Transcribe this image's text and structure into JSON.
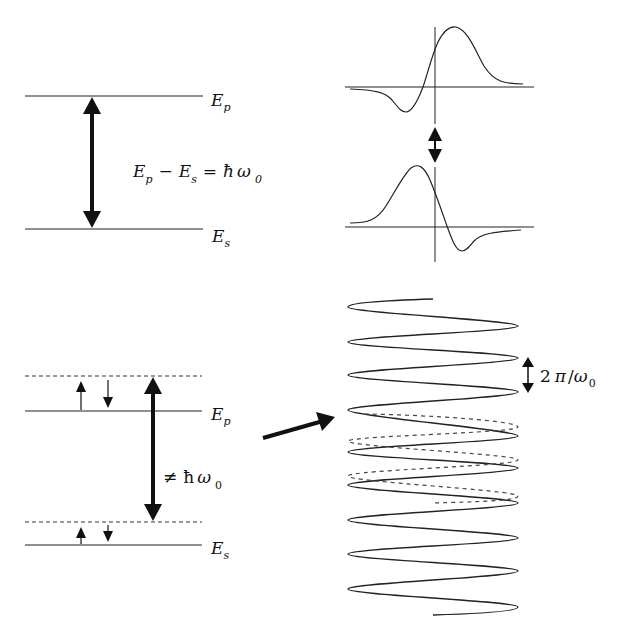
{
  "panels": {
    "top_left": {
      "upper_level_label": "E",
      "upper_level_sub": "p",
      "lower_level_label": "E",
      "lower_level_sub": "s",
      "equation": {
        "a": "E",
        "a_sub": "p",
        "minus": "−",
        "b": "E",
        "b_sub": "s",
        "eq": "=",
        "hbar": "ħ",
        "omega": "ω",
        "omega_sub": "0"
      }
    },
    "top_right": {
      "description": "Two wavepacket curves (antisymmetric derivative-like shapes) connected by a double-headed arrow"
    },
    "bottom_left": {
      "upper_level_label": "E",
      "upper_level_sub": "p",
      "lower_level_label": "E",
      "lower_level_sub": "s",
      "transition": {
        "neq": "≠",
        "hbar": "ħ",
        "omega": "ω",
        "omega_sub": "0"
      }
    },
    "bottom_right": {
      "period_label": {
        "two": "2",
        "pi": "π",
        "slash": "/",
        "omega": "ω",
        "omega_sub": "0"
      },
      "description": "Solid oscillating wave with dashed out-of-phase wave segment"
    }
  }
}
